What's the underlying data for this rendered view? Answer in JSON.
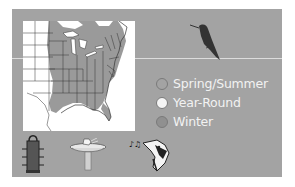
{
  "figure": {
    "background_color": "#a3a3a3",
    "map": {
      "region": "Eastern United States range map",
      "range_fill_color": "#999999",
      "land_color": "#ffffff"
    },
    "legend": {
      "items": [
        {
          "label": "Spring/Summer",
          "color": "#a3a3a3"
        },
        {
          "label": "Year-Round",
          "color": "#f4f4f4"
        },
        {
          "label": "Winter",
          "color": "#909090"
        }
      ]
    },
    "icons": {
      "bird": "hummingbird-silhouette-icon",
      "feeder": "tube-feeder-icon",
      "birdbath": "birdbath-icon",
      "song": "singing-bird-head-icon"
    }
  }
}
